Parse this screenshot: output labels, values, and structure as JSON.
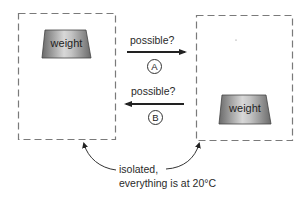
{
  "diagram": {
    "left_system": {
      "weight_label": "weight",
      "weight_position": "top"
    },
    "right_system": {
      "weight_label": "weight",
      "weight_position": "bottom"
    },
    "arrow_a": {
      "question": "possible?",
      "letter": "A",
      "direction": "left-to-right"
    },
    "arrow_b": {
      "question": "possible?",
      "letter": "B",
      "direction": "right-to-left"
    },
    "caption": {
      "line1": "isolated,",
      "line2": "everything is at 20°C"
    },
    "colors": {
      "dash": "#7a7a7a",
      "arrow": "#222222",
      "weight_dark": "#6e6e6e",
      "weight_light": "#d6d6d6"
    }
  }
}
